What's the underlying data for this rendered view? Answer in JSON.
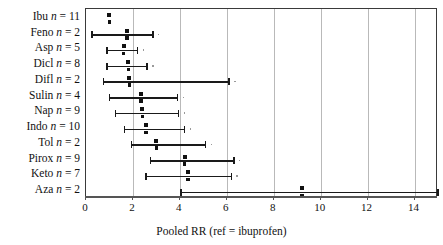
{
  "chart_data": {
    "type": "scatter",
    "title": "",
    "subtitle": "",
    "xlabel": "Pooled RR (ref = ibuprofen)",
    "ylabel": "",
    "xlim": [
      0,
      15
    ],
    "xticks": [
      0,
      2,
      4,
      6,
      8,
      10,
      12,
      14
    ],
    "xticklabels": [
      "0",
      "2",
      "4",
      "6",
      "8",
      "10",
      "12",
      "14"
    ],
    "grid": "vertical-at-xticks",
    "legend": "none",
    "categories": [
      "Ibu n = 11",
      "Feno n = 2",
      "Asp n = 5",
      "Dicl n = 8",
      "Difl n = 2",
      "Sulin n = 4",
      "Nap n = 9",
      "Indo n = 10",
      "Tol n = 2",
      "Pirox n = 9",
      "Keto n = 7",
      "Aza n = 2"
    ],
    "rows": [
      {
        "drug": "Ibu",
        "n": 11,
        "label": "Ibu n = 11",
        "rr": 1.0,
        "ci_low": null,
        "ci_high": null
      },
      {
        "drug": "Feno",
        "n": 2,
        "label": "Feno n = 2",
        "rr": 1.75,
        "ci_low": 0.25,
        "ci_high": 2.85
      },
      {
        "drug": "Asp",
        "n": 5,
        "label": "Asp n = 5",
        "rr": 1.6,
        "ci_low": 0.9,
        "ci_high": 2.2
      },
      {
        "drug": "Dicl",
        "n": 8,
        "label": "Dicl n = 8",
        "rr": 1.8,
        "ci_low": 0.9,
        "ci_high": 2.6
      },
      {
        "drug": "Difl",
        "n": 2,
        "label": "Difl n = 2",
        "rr": 1.85,
        "ci_low": 0.75,
        "ci_high": 6.1
      },
      {
        "drug": "Sulin",
        "n": 4,
        "label": "Sulin n = 4",
        "rr": 2.35,
        "ci_low": 1.0,
        "ci_high": 3.9
      },
      {
        "drug": "Nap",
        "n": 9,
        "label": "Nap n = 9",
        "rr": 2.4,
        "ci_low": 1.25,
        "ci_high": 3.95
      },
      {
        "drug": "Indo",
        "n": 10,
        "label": "Indo n = 10",
        "rr": 2.55,
        "ci_low": 1.65,
        "ci_high": 4.2
      },
      {
        "drug": "Tol",
        "n": 2,
        "label": "Tol n = 2",
        "rr": 3.0,
        "ci_low": 1.95,
        "ci_high": 5.1
      },
      {
        "drug": "Pirox",
        "n": 9,
        "label": "Pirox n = 9",
        "rr": 4.2,
        "ci_low": 2.75,
        "ci_high": 6.3
      },
      {
        "drug": "Keto",
        "n": 7,
        "label": "Keto n = 7",
        "rr": 4.35,
        "ci_low": 2.55,
        "ci_high": 6.2
      },
      {
        "drug": "Aza",
        "n": 2,
        "label": "Aza n = 2",
        "rr": 9.2,
        "ci_low": 4.05,
        "ci_high": 15.0
      }
    ],
    "reference_line": 1.0,
    "marker": "square-point-with-horizontal-ci"
  },
  "axis": {
    "x_label_text": "Pooled RR (ref = ibuprofen)",
    "tick_labels": [
      "0",
      "2",
      "4",
      "6",
      "8",
      "10",
      "12",
      "14"
    ]
  },
  "colors": {
    "marker": "#111111",
    "ci": "#1a1a1a",
    "grid": "#b9b9b9",
    "frame": "#3a3a3a",
    "axis": "#555555",
    "background": "#ffffff",
    "text": "#111111"
  }
}
